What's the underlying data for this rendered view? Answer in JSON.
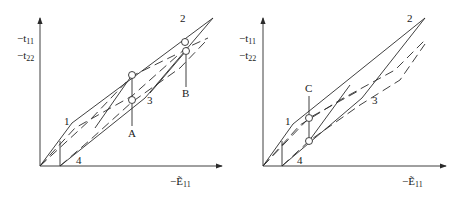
{
  "figure": {
    "panels": [
      {
        "id": "left",
        "y_axis_labels": [
          "-t11",
          "-t22"
        ],
        "x_axis_label": "-Ẽ11",
        "point_labels": [
          "1",
          "2",
          "3",
          "4"
        ],
        "markers": [
          "A",
          "B"
        ]
      },
      {
        "id": "right",
        "y_axis_labels": [
          "-t11",
          "-t22"
        ],
        "x_axis_label": "-Ẽ11",
        "point_labels": [
          "1",
          "2",
          "3",
          "4"
        ],
        "markers": [
          "C"
        ]
      }
    ]
  },
  "left": {
    "ylab1": "−t",
    "ylab1_sub": "11",
    "ylab2": "−t",
    "ylab2_sub": "22",
    "xlab": "−Ẽ",
    "xlab_sub": "11",
    "p1": "1",
    "p2": "2",
    "p3": "3",
    "p4": "4",
    "mA": "A",
    "mB": "B"
  },
  "right": {
    "ylab1": "−t",
    "ylab1_sub": "11",
    "ylab2": "−t",
    "ylab2_sub": "22",
    "xlab": "−Ẽ",
    "xlab_sub": "11",
    "p1": "1",
    "p2": "2",
    "p3": "3",
    "p4": "4",
    "mC": "C"
  },
  "colors": {
    "line": "#2a2a2a",
    "background": "#ffffff"
  }
}
